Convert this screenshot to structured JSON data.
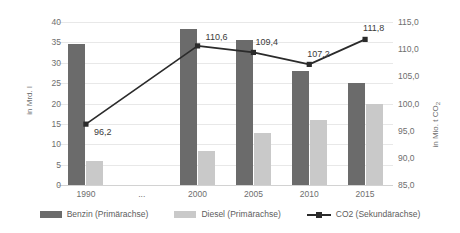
{
  "chart_data": {
    "type": "bar",
    "title": "",
    "subtitle": "",
    "xlabel": "",
    "categories": [
      "1990",
      "...",
      "2000",
      "2005",
      "2010",
      "2015"
    ],
    "grid": true,
    "legend_position": "bottom",
    "primary_axis": {
      "label": "in Mrd. l",
      "ylim": [
        0,
        40
      ],
      "tick_step": 5,
      "ticks": [
        "40",
        "35",
        "30",
        "25",
        "20",
        "15",
        "10",
        "5",
        "0"
      ]
    },
    "secondary_axis": {
      "label": "in Mio. t CO2",
      "label_main": "in Mio. t CO",
      "label_sub": "2",
      "ylim": [
        85.0,
        115.0
      ],
      "tick_step": 5.0,
      "ticks": [
        "115,0",
        "110,0",
        "105,0",
        "100,0",
        "95,0",
        "90,0",
        "85,0"
      ]
    },
    "series": [
      {
        "name": "Benzin (Primärachse)",
        "type": "bar",
        "axis": "primary",
        "color": "#6b6b6b",
        "values": [
          34.5,
          null,
          38.3,
          35.5,
          28.0,
          25.0
        ]
      },
      {
        "name": "Diesel (Primärachse)",
        "type": "bar",
        "axis": "primary",
        "color": "#c9c9c9",
        "values": [
          6.0,
          null,
          8.4,
          12.8,
          16.0,
          20.0
        ]
      },
      {
        "name": "CO2 (Sekundärachse)",
        "type": "line",
        "axis": "secondary",
        "color": "#2b2b2b",
        "values": [
          96.2,
          null,
          110.6,
          109.4,
          107.2,
          111.8
        ],
        "data_labels": [
          "96,2",
          null,
          "110,6",
          "109,4",
          "107,2",
          "111,8"
        ]
      }
    ]
  },
  "legend": {
    "items": [
      {
        "label": "Benzin (Primärachse)",
        "swatch": "benzin-swatch"
      },
      {
        "label": "Diesel (Primärachse)",
        "swatch": "diesel-swatch"
      },
      {
        "label": "CO2 (Sekundärachse)",
        "swatch": "co2-line-swatch"
      }
    ]
  }
}
